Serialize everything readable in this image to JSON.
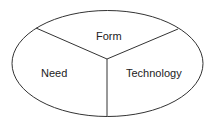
{
  "diagram": {
    "shape": "ellipse-divided-into-three",
    "segments": [
      {
        "id": "form",
        "label": "Form"
      },
      {
        "id": "need",
        "label": "Need"
      },
      {
        "id": "technology",
        "label": "Technology"
      }
    ],
    "stroke_color": "#333333"
  }
}
